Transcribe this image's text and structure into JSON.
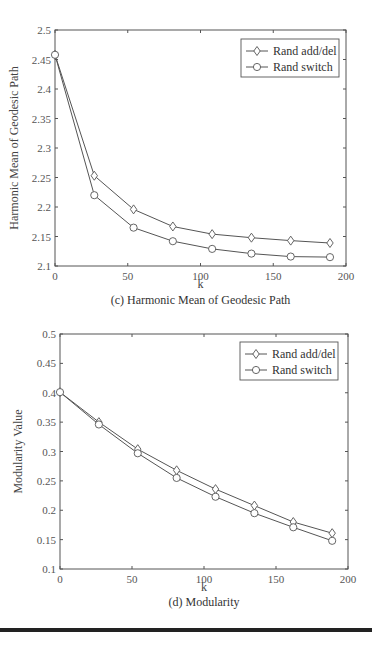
{
  "chart_data": [
    {
      "type": "line",
      "title": "",
      "caption": "(c) Harmonic Mean of Geodesic Path",
      "xlabel": "k",
      "ylabel": "Harmonic Mean of Geodesic Path",
      "xlim": [
        0,
        200
      ],
      "ylim": [
        2.1,
        2.5
      ],
      "xticks": [
        "0",
        "50",
        "100",
        "150",
        "200"
      ],
      "yticks": [
        "2.1",
        "2.15",
        "2.2",
        "2.25",
        "2.3",
        "2.35",
        "2.4",
        "2.45",
        "2.5"
      ],
      "grid": false,
      "legend_position": "upper right",
      "x": [
        0,
        27,
        54,
        81,
        108,
        135,
        162,
        189
      ],
      "series": [
        {
          "name": "Rand add/del",
          "marker": "diamond",
          "values": [
            2.458,
            2.253,
            2.196,
            2.167,
            2.154,
            2.148,
            2.143,
            2.139
          ]
        },
        {
          "name": "Rand switch",
          "marker": "circle",
          "values": [
            2.458,
            2.22,
            2.165,
            2.142,
            2.129,
            2.121,
            2.116,
            2.115
          ]
        }
      ]
    },
    {
      "type": "line",
      "title": "",
      "caption": "(d) Modularity",
      "xlabel": "k",
      "ylabel": "Modularity Value",
      "xlim": [
        0,
        200
      ],
      "ylim": [
        0.1,
        0.5
      ],
      "xticks": [
        "0",
        "50",
        "100",
        "150",
        "200"
      ],
      "yticks": [
        "0.1",
        "0.15",
        "0.2",
        "0.25",
        "0.3",
        "0.35",
        "0.4",
        "0.45",
        "0.5"
      ],
      "grid": false,
      "legend_position": "upper right",
      "x": [
        0,
        27,
        54,
        81,
        108,
        135,
        162,
        189
      ],
      "series": [
        {
          "name": "Rand add/del",
          "marker": "diamond",
          "values": [
            0.401,
            0.35,
            0.304,
            0.268,
            0.236,
            0.208,
            0.18,
            0.161
          ]
        },
        {
          "name": "Rand switch",
          "marker": "circle",
          "values": [
            0.401,
            0.346,
            0.297,
            0.255,
            0.223,
            0.195,
            0.171,
            0.148
          ]
        }
      ]
    }
  ]
}
